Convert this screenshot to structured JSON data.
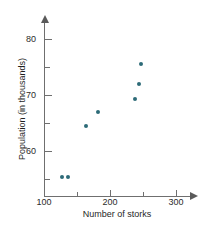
{
  "chart_data": {
    "type": "scatter",
    "title": "",
    "xlabel": "Number of storks",
    "ylabel": "Population (in thousands)",
    "xlim": [
      100,
      320
    ],
    "ylim": [
      53,
      81
    ],
    "grid": false,
    "legend": null,
    "x_major_ticks": [
      100,
      200,
      300
    ],
    "x_minor_ticks": [
      150,
      250
    ],
    "x_tick_labels": [
      "100",
      "200",
      "300"
    ],
    "y_major_ticks": [
      60,
      70,
      80
    ],
    "y_minor_ticks": [
      55,
      65,
      75
    ],
    "y_tick_labels": [
      "60",
      "70",
      "80"
    ],
    "point_color": "#2d6b78",
    "axis_color": "#6f6f6f",
    "series": [
      {
        "name": "storks vs population",
        "points": [
          {
            "x": 127,
            "y": 55.4
          },
          {
            "x": 136,
            "y": 55.4
          },
          {
            "x": 163,
            "y": 64.4
          },
          {
            "x": 182,
            "y": 66.9
          },
          {
            "x": 238,
            "y": 69.3
          },
          {
            "x": 244,
            "y": 72.0
          },
          {
            "x": 247,
            "y": 75.5
          }
        ]
      }
    ]
  }
}
